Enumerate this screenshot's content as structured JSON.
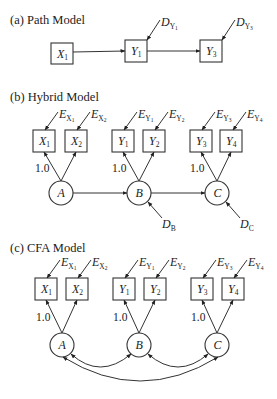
{
  "panels": [
    {
      "id": "a",
      "title": "(a) Path Model",
      "title_pos": [
        10,
        24
      ],
      "boxes": [
        {
          "name": "X",
          "sub": "1",
          "x": 51,
          "y": 43,
          "w": 22,
          "h": 21
        },
        {
          "name": "Y",
          "sub": "1",
          "x": 125,
          "y": 40,
          "w": 22,
          "h": 22
        },
        {
          "name": "Y",
          "sub": "3",
          "x": 200,
          "y": 40,
          "w": 22,
          "h": 22
        }
      ],
      "circles": [],
      "paths": [
        {
          "from": [
            73,
            52
          ],
          "to": [
            125,
            51
          ]
        },
        {
          "from": [
            147,
            51
          ],
          "to": [
            200,
            51
          ]
        }
      ],
      "disturbances": [
        {
          "label": "D",
          "sub": "Y",
          "subsub": "1",
          "from": [
            160,
            20
          ],
          "to": [
            147,
            40
          ],
          "lx": 161,
          "ly": 26
        },
        {
          "label": "D",
          "sub": "Y",
          "subsub": "3",
          "from": [
            235,
            20
          ],
          "to": [
            222,
            40
          ],
          "lx": 236,
          "ly": 26
        }
      ],
      "loadings": [],
      "correlations": []
    },
    {
      "id": "b",
      "title": "(b) Hybrid Model",
      "title_pos": [
        10,
        101
      ],
      "boxes": [
        {
          "name": "X",
          "sub": "1",
          "x": 33,
          "y": 130,
          "w": 22,
          "h": 22
        },
        {
          "name": "X",
          "sub": "2",
          "x": 65,
          "y": 130,
          "w": 22,
          "h": 22
        },
        {
          "name": "Y",
          "sub": "1",
          "x": 112,
          "y": 130,
          "w": 22,
          "h": 22
        },
        {
          "name": "Y",
          "sub": "2",
          "x": 143,
          "y": 130,
          "w": 22,
          "h": 22
        },
        {
          "name": "Y",
          "sub": "3",
          "x": 190,
          "y": 130,
          "w": 22,
          "h": 22
        },
        {
          "name": "Y",
          "sub": "4",
          "x": 220,
          "y": 130,
          "w": 22,
          "h": 22
        }
      ],
      "circles": [
        {
          "name": "A",
          "cx": 61,
          "cy": 193,
          "r": 12
        },
        {
          "name": "B",
          "cx": 139,
          "cy": 193,
          "r": 12
        },
        {
          "name": "C",
          "cx": 217,
          "cy": 193,
          "r": 12
        }
      ],
      "loadings": [
        {
          "from": [
            61,
            181
          ],
          "to": [
            44,
            152
          ]
        },
        {
          "from": [
            61,
            181
          ],
          "to": [
            76,
            152
          ]
        },
        {
          "from": [
            139,
            181
          ],
          "to": [
            123,
            152
          ]
        },
        {
          "from": [
            139,
            181
          ],
          "to": [
            154,
            152
          ]
        },
        {
          "from": [
            217,
            181
          ],
          "to": [
            201,
            152
          ]
        },
        {
          "from": [
            217,
            181
          ],
          "to": [
            231,
            152
          ]
        }
      ],
      "errors": [
        {
          "label": "E",
          "sub": "X",
          "subsub": "1",
          "from": [
            58,
            112
          ],
          "to": [
            45,
            130
          ],
          "lx": 59,
          "ly": 118
        },
        {
          "label": "E",
          "sub": "X",
          "subsub": "2",
          "from": [
            90,
            112
          ],
          "to": [
            77,
            130
          ],
          "lx": 91,
          "ly": 118
        },
        {
          "label": "E",
          "sub": "Y",
          "subsub": "1",
          "from": [
            137,
            112
          ],
          "to": [
            124,
            130
          ],
          "lx": 138,
          "ly": 118
        },
        {
          "label": "E",
          "sub": "Y",
          "subsub": "2",
          "from": [
            168,
            112
          ],
          "to": [
            155,
            130
          ],
          "lx": 169,
          "ly": 118
        },
        {
          "label": "E",
          "sub": "Y",
          "subsub": "3",
          "from": [
            215,
            112
          ],
          "to": [
            202,
            130
          ],
          "lx": 216,
          "ly": 118
        },
        {
          "label": "E",
          "sub": "Y",
          "subsub": "4",
          "from": [
            246,
            112
          ],
          "to": [
            233,
            130
          ],
          "lx": 247,
          "ly": 118
        }
      ],
      "fixed_labels": [
        {
          "text": "1.0",
          "x": 35,
          "y": 172
        },
        {
          "text": "1.0",
          "x": 112,
          "y": 172
        },
        {
          "text": "1.0",
          "x": 190,
          "y": 172
        }
      ],
      "paths": [
        {
          "from": [
            73,
            193
          ],
          "to": [
            127,
            193
          ]
        },
        {
          "from": [
            151,
            193
          ],
          "to": [
            205,
            193
          ]
        }
      ],
      "disturbances": [
        {
          "label": "D",
          "sub": "B",
          "subsub": "",
          "from": [
            162,
            218
          ],
          "to": [
            148,
            202
          ],
          "lx": 162,
          "ly": 228
        },
        {
          "label": "D",
          "sub": "C",
          "subsub": "",
          "from": [
            240,
            218
          ],
          "to": [
            226,
            202
          ],
          "lx": 240,
          "ly": 228
        }
      ],
      "correlations": []
    },
    {
      "id": "c",
      "title": "(c) CFA Model",
      "title_pos": [
        10,
        252
      ],
      "boxes": [
        {
          "name": "X",
          "sub": "1",
          "x": 35,
          "y": 278,
          "w": 22,
          "h": 22
        },
        {
          "name": "X",
          "sub": "2",
          "x": 66,
          "y": 278,
          "w": 22,
          "h": 22
        },
        {
          "name": "Y",
          "sub": "1",
          "x": 113,
          "y": 278,
          "w": 22,
          "h": 22
        },
        {
          "name": "Y",
          "sub": "2",
          "x": 144,
          "y": 278,
          "w": 22,
          "h": 22
        },
        {
          "name": "Y",
          "sub": "3",
          "x": 191,
          "y": 278,
          "w": 22,
          "h": 22
        },
        {
          "name": "Y",
          "sub": "4",
          "x": 222,
          "y": 278,
          "w": 22,
          "h": 22
        }
      ],
      "circles": [
        {
          "name": "A",
          "cx": 62,
          "cy": 345,
          "r": 12
        },
        {
          "name": "B",
          "cx": 139,
          "cy": 345,
          "r": 12
        },
        {
          "name": "C",
          "cx": 217,
          "cy": 345,
          "r": 12
        }
      ],
      "loadings": [
        {
          "from": [
            62,
            333
          ],
          "to": [
            46,
            300
          ]
        },
        {
          "from": [
            62,
            333
          ],
          "to": [
            77,
            300
          ]
        },
        {
          "from": [
            139,
            333
          ],
          "to": [
            124,
            300
          ]
        },
        {
          "from": [
            139,
            333
          ],
          "to": [
            155,
            300
          ]
        },
        {
          "from": [
            217,
            333
          ],
          "to": [
            202,
            300
          ]
        },
        {
          "from": [
            217,
            333
          ],
          "to": [
            233,
            300
          ]
        }
      ],
      "errors": [
        {
          "label": "E",
          "sub": "X",
          "subsub": "1",
          "from": [
            60,
            260
          ],
          "to": [
            47,
            278
          ],
          "lx": 61,
          "ly": 266
        },
        {
          "label": "E",
          "sub": "X",
          "subsub": "2",
          "from": [
            91,
            260
          ],
          "to": [
            78,
            278
          ],
          "lx": 92,
          "ly": 266
        },
        {
          "label": "E",
          "sub": "Y",
          "subsub": "1",
          "from": [
            138,
            260
          ],
          "to": [
            125,
            278
          ],
          "lx": 139,
          "ly": 266
        },
        {
          "label": "E",
          "sub": "Y",
          "subsub": "2",
          "from": [
            169,
            260
          ],
          "to": [
            156,
            278
          ],
          "lx": 170,
          "ly": 266
        },
        {
          "label": "E",
          "sub": "Y",
          "subsub": "3",
          "from": [
            216,
            260
          ],
          "to": [
            203,
            278
          ],
          "lx": 217,
          "ly": 266
        },
        {
          "label": "E",
          "sub": "Y",
          "subsub": "4",
          "from": [
            247,
            260
          ],
          "to": [
            234,
            278
          ],
          "lx": 248,
          "ly": 266
        }
      ],
      "fixed_labels": [
        {
          "text": "1.0",
          "x": 36,
          "y": 321
        },
        {
          "text": "1.0",
          "x": 113,
          "y": 321
        },
        {
          "text": "1.0",
          "x": 191,
          "y": 321
        }
      ],
      "paths": [],
      "disturbances": [],
      "correlations": [
        {
          "d": "M 71 354 Q 100 380 131 354",
          "start": [
            71,
            354
          ],
          "end": [
            131,
            354
          ]
        },
        {
          "d": "M 148 354 Q 178 380 208 354",
          "start": [
            148,
            354
          ],
          "end": [
            208,
            354
          ]
        },
        {
          "d": "M 63 357 Q 140 405 218 357",
          "start": [
            63,
            357
          ],
          "end": [
            218,
            357
          ]
        }
      ]
    }
  ]
}
